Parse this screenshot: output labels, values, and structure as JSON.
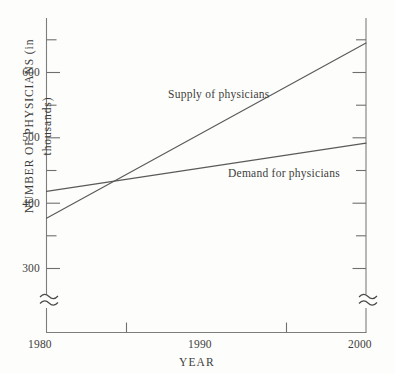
{
  "chart_data": {
    "type": "line",
    "title": "",
    "xlabel": "YEAR",
    "ylabel": "NUMBER OF PHYSICIANS (in thousands)",
    "xlim": [
      1980,
      2000
    ],
    "ylim": [
      285,
      665
    ],
    "grid": false,
    "legend_position": "inline-annotation",
    "axis_break": "≈",
    "axis_break_note": "y-axis broken below 285 (zigzag marks on both vertical axes)",
    "xticks_major": [
      1980,
      1990,
      2000
    ],
    "xticks_major_labels": [
      "1980",
      "1990",
      "2000"
    ],
    "xticks_minor": [
      1985,
      1995
    ],
    "yticks_major": [
      300,
      400,
      500,
      600
    ],
    "yticks_major_labels": [
      "300",
      "400",
      "500",
      "600"
    ],
    "yticks_minor": [
      350,
      450,
      550,
      650
    ],
    "x": [
      1980,
      2000
    ],
    "series": [
      {
        "name": "Supply of physicians",
        "label": "Supply of physicians",
        "values": [
          377,
          645
        ],
        "label_x": 1990,
        "label_y": 570
      },
      {
        "name": "Demand for physicians",
        "label": "Demand for physicians",
        "values": [
          418,
          492
        ],
        "label_x": 1993.5,
        "label_y": 448
      }
    ],
    "intersection": {
      "x": 1984,
      "y": 425
    },
    "colors": {
      "background": "#fdfdfb",
      "axis": "#7d7d7d",
      "line": "#5a5a5a",
      "text": "#3d3d3d"
    }
  },
  "labels": {
    "ytick_600": "600",
    "ytick_500": "500",
    "ytick_400": "400",
    "ytick_300": "300",
    "xtick_1980": "1980",
    "xtick_1990": "1990",
    "xtick_2000": "2000",
    "axis_title_x": "YEAR",
    "axis_title_y": "NUMBER OF PHYSICIANS (in thousands)",
    "series_supply": "Supply of physicians",
    "series_demand": "Demand for physicians"
  }
}
